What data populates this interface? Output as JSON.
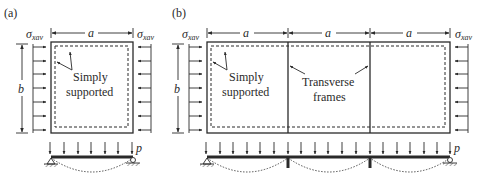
{
  "panels": [
    {
      "id": "a",
      "label": "(a)",
      "dim_width": "a",
      "dim_height": "b",
      "stress_left": "σ",
      "stress_left_sub": "xav",
      "stress_right": "σ",
      "stress_right_sub": "xav",
      "annotation_line1": "Simply",
      "annotation_line2": "supported",
      "load_label": "p"
    },
    {
      "id": "b",
      "label": "(b)",
      "dim_width_1": "a",
      "dim_width_2": "a",
      "dim_width_3": "a",
      "dim_height": "b",
      "stress_left": "σ",
      "stress_left_sub": "xav",
      "stress_right": "σ",
      "stress_right_sub": "xav",
      "annotation_line1": "Simply",
      "annotation_line2": "supported",
      "frames_line1": "Transverse",
      "frames_line2": "frames",
      "load_label": "p"
    }
  ],
  "colors": {
    "ink": "#2a2a2a",
    "background": "#ffffff"
  }
}
